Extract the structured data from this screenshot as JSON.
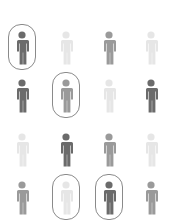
{
  "figure": {
    "colors": {
      "dark": "#6b6b6b",
      "medium": "#9a9a9a",
      "light": "#e6e6e6",
      "outline": "#8a8a8a"
    },
    "rows": [
      [
        {
          "shade": "dark",
          "circled": true
        },
        {
          "shade": "light",
          "circled": false
        },
        {
          "shade": "medium",
          "circled": false
        },
        {
          "shade": "light",
          "circled": false
        }
      ],
      [
        {
          "shade": "dark",
          "circled": false
        },
        {
          "shade": "medium",
          "circled": true
        },
        {
          "shade": "light",
          "circled": false
        },
        {
          "shade": "dark",
          "circled": false
        }
      ],
      [
        {
          "shade": "light",
          "circled": false
        },
        {
          "shade": "dark",
          "circled": false
        },
        {
          "shade": "medium",
          "circled": false
        },
        {
          "shade": "light",
          "circled": false
        }
      ],
      [
        {
          "shade": "medium",
          "circled": false
        },
        {
          "shade": "light",
          "circled": true
        },
        {
          "shade": "dark",
          "circled": true
        },
        {
          "shade": "medium",
          "circled": false
        }
      ]
    ]
  }
}
